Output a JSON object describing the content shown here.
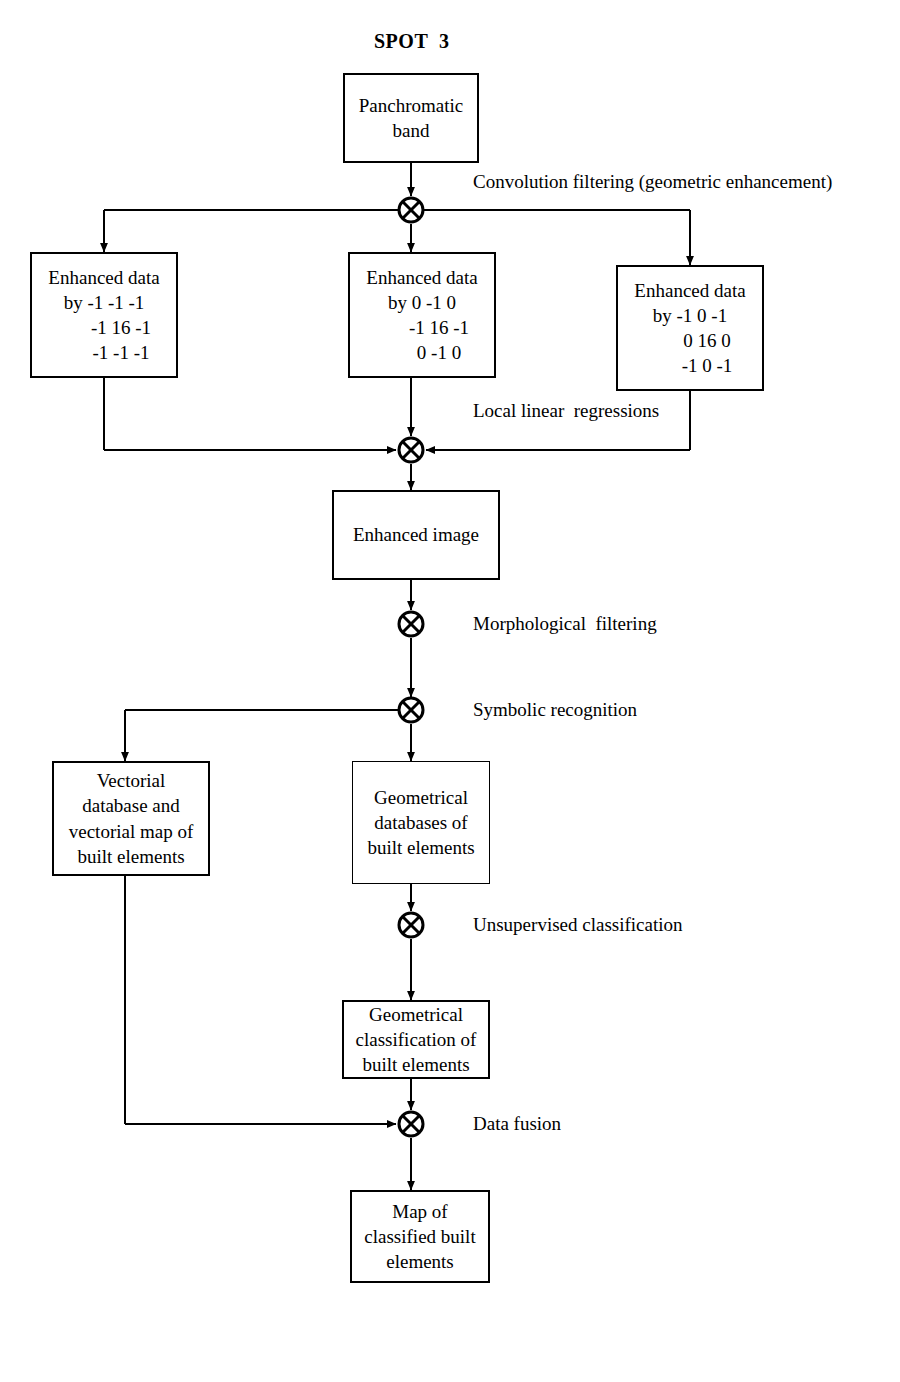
{
  "diagram": {
    "title": "SPOT  3",
    "nodes": {
      "panchromatic": {
        "line1": "Panchromatic",
        "line2": "band"
      },
      "enhanced_left": {
        "line1": "Enhanced data",
        "line2": "by -1 -1 -1",
        "line3": "-1 16 -1",
        "line4": "-1 -1 -1"
      },
      "enhanced_middle": {
        "line1": "Enhanced data",
        "line2": "by 0 -1 0",
        "line3": "-1 16 -1",
        "line4": "0 -1 0"
      },
      "enhanced_right": {
        "line1": "Enhanced data",
        "line2": "by -1 0 -1",
        "line3": "0 16 0",
        "line4": "-1 0 -1"
      },
      "enhanced_image": {
        "line1": "Enhanced image"
      },
      "vectorial_db": {
        "line1": "Vectorial",
        "line2": "database and",
        "line3": "vectorial map of",
        "line4": "built elements"
      },
      "geometrical_db": {
        "line1": "Geometrical",
        "line2": "databases of",
        "line3": "built elements"
      },
      "geometrical_classification": {
        "line1": "Geometrical",
        "line2": "classification of",
        "line3": "built elements"
      },
      "map_classified": {
        "line1": "Map of",
        "line2": "classified built",
        "line3": "elements"
      }
    },
    "edge_labels": {
      "convolution": "Convolution filtering (geometric enhancement)",
      "local_linear": "Local linear  regressions",
      "morphological": "Morphological  filtering",
      "symbolic": "Symbolic recognition",
      "unsupervised": "Unsupervised classification",
      "data_fusion": "Data fusion"
    },
    "junction_icon": "circle-cross-icon",
    "colors": {
      "line": "#000000",
      "background": "#ffffff",
      "text": "#000000"
    }
  }
}
